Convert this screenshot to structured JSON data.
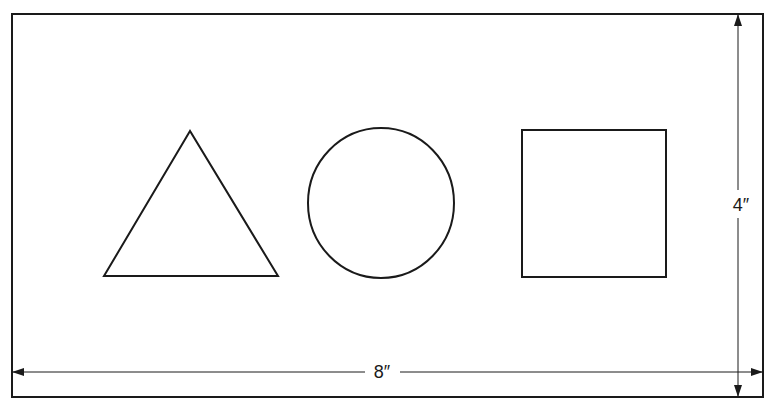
{
  "diagram": {
    "frame": {
      "width_label": "8″",
      "height_label": "4″"
    },
    "shapes": [
      {
        "type": "triangle"
      },
      {
        "type": "circle"
      },
      {
        "type": "square"
      }
    ],
    "colors": {
      "stroke": "#1a1a1a",
      "background": "#ffffff"
    }
  }
}
